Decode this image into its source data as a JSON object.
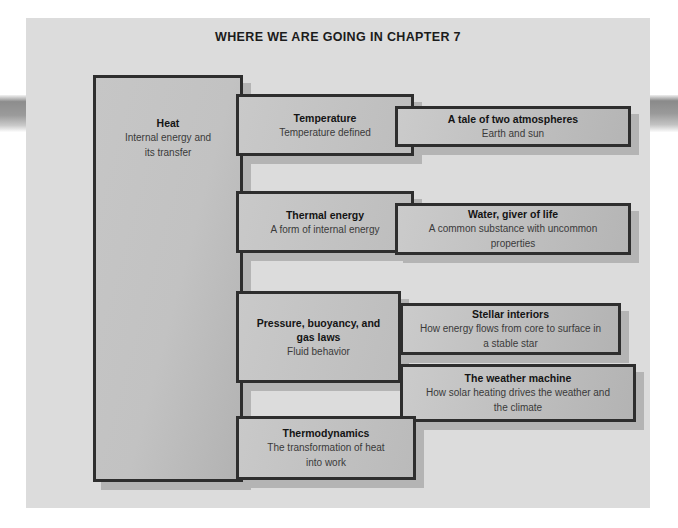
{
  "figure": {
    "title": "WHERE WE ARE GOING IN CHAPTER 7",
    "colors": {
      "page_background": "#dcdcdc",
      "box_fill": "#c4c4c4",
      "box_border": "#2e2e2e",
      "box_shadow": "#b4b4b4",
      "title_text": "#1b1b1b",
      "subtitle_text": "#3a3a3a"
    }
  },
  "nodes": {
    "heat": {
      "title": "Heat",
      "subtitle": "Internal energy and its transfer",
      "subtitle_line1": "Internal energy and",
      "subtitle_line2": "its transfer"
    },
    "temperature": {
      "title": "Temperature",
      "subtitle": "Temperature defined"
    },
    "atmospheres": {
      "title": "A tale of two atmospheres",
      "subtitle": "Earth and sun"
    },
    "thermal_energy": {
      "title": "Thermal energy",
      "subtitle": "A form of internal energy"
    },
    "water": {
      "title": "Water, giver of life",
      "subtitle": "A common substance with uncommon properties",
      "subtitle_line1": "A common substance with uncommon",
      "subtitle_line2": "properties"
    },
    "pressure": {
      "title": "Pressure, buoyancy, and gas laws",
      "title_line1": "Pressure, buoyancy, and",
      "title_line2": "gas laws",
      "subtitle": "Fluid behavior"
    },
    "stellar": {
      "title": "Stellar interiors",
      "subtitle": "How energy flows from core to surface in a stable star",
      "subtitle_line1": "How energy flows from core to surface in",
      "subtitle_line2": "a stable star"
    },
    "weather": {
      "title": "The weather machine",
      "subtitle": "How solar heating drives the weather and the climate",
      "subtitle_line1": "How solar heating drives the weather and",
      "subtitle_line2": "the climate"
    },
    "thermodynamics": {
      "title": "Thermodynamics",
      "subtitle": "The transformation of heat into work",
      "subtitle_line1": "The transformation of heat",
      "subtitle_line2": "into work"
    }
  }
}
